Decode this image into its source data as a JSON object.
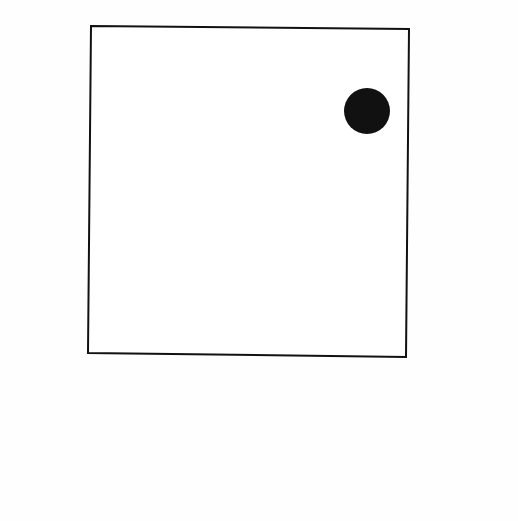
{
  "canvas": {
    "width": 518,
    "height": 521,
    "background": "#fefefe"
  },
  "square": {
    "points": "91,26 409,29 406,357 88,353",
    "stroke": "#111111",
    "stroke_width": 2,
    "fill": "#ffffff"
  },
  "dot": {
    "cx": 367,
    "cy": 111,
    "r": 23,
    "fill": "#111111"
  }
}
